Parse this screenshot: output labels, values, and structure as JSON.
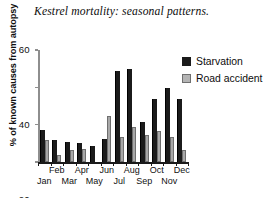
{
  "chart_data": {
    "type": "bar",
    "title": "Kestrel mortality: seasonal patterns.",
    "xlabel": "",
    "ylabel": "% of known causes from autopsy",
    "ylim": [
      0,
      60
    ],
    "yticks": [
      0,
      20,
      40,
      60
    ],
    "ytick_labels": [
      "0",
      "20",
      "40",
      "60"
    ],
    "grid": false,
    "legend_position": "right-top",
    "categories": [
      "Jan",
      "Feb",
      "Mar",
      "Apr",
      "May",
      "Jun",
      "Jul",
      "Aug",
      "Sep",
      "Oct",
      "Nov",
      "Dec"
    ],
    "series": [
      {
        "name": "Starvation",
        "color": "#1b1b1b",
        "values": [
          17,
          12,
          10.5,
          10,
          8.5,
          12.5,
          49,
          50,
          21.5,
          33.5,
          39.5,
          33.5
        ]
      },
      {
        "name": "Road accident",
        "color": "#a8a8a8",
        "values": [
          12,
          4,
          6.5,
          7,
          0,
          24.5,
          13.5,
          18.5,
          14.5,
          16.5,
          13.5,
          6.5
        ]
      }
    ]
  },
  "legend": {
    "items": [
      {
        "label": "Starvation",
        "swatch": "starvation"
      },
      {
        "label": "Road accident",
        "swatch": "road"
      }
    ]
  }
}
